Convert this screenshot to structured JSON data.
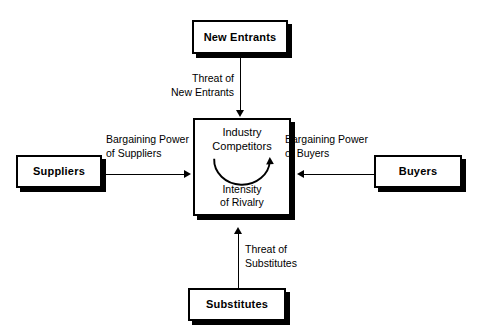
{
  "diagram": {
    "background_color": "#ffffff",
    "line_color": "#000000",
    "nodes": {
      "new_entrants": {
        "label": "New Entrants"
      },
      "suppliers": {
        "label": "Suppliers"
      },
      "buyers": {
        "label": "Buyers"
      },
      "substitutes": {
        "label": "Substitutes"
      },
      "industry_competitors": {
        "title_line1": "Industry",
        "title_line2": "Competitors",
        "sub_line1": "Intensity",
        "sub_line2": "of  Rivalry",
        "title": "Industry Competitors",
        "subtitle": "Intensity of Rivalry"
      }
    },
    "edges": {
      "threat_of_new_entrants": {
        "line1": "Threat of",
        "line2": "New Entrants",
        "label": "Threat of New Entrants",
        "direction": "down"
      },
      "bargaining_power_of_suppliers": {
        "line1": "Bargaining Power",
        "line2": "of Suppliers",
        "label": "Bargaining Power of Suppliers",
        "direction": "right"
      },
      "bargaining_power_of_buyers": {
        "line1": "Bargaining Power",
        "line2": "of Buyers",
        "label": "Bargaining Power of Buyers",
        "direction": "left"
      },
      "threat_of_substitutes": {
        "line1": "Threat of",
        "line2": "Substitutes",
        "label": "Threat of Substitutes",
        "direction": "up"
      }
    }
  }
}
